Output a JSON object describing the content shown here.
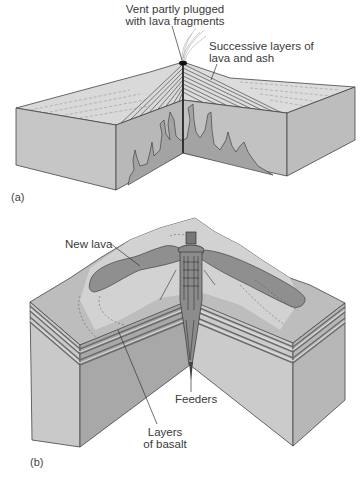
{
  "figure": {
    "panels": [
      {
        "tag": "(a)",
        "title": "Composite volcano cross-section",
        "labels": {
          "vent": [
            "Vent partly plugged",
            "with lava fragments"
          ],
          "layers": [
            "Successive layers of",
            "lava and ash"
          ]
        }
      },
      {
        "tag": "(b)",
        "title": "Fissure eruption / flood basalt cross-section",
        "labels": {
          "new_lava": "New lava",
          "feeders": "Feeders",
          "basalt": [
            "Layers",
            "of basalt"
          ]
        }
      }
    ],
    "colors": {
      "face_light": "#c9c9c9",
      "face_mid": "#b4b4b4",
      "face_dark": "#9d9d9d",
      "top_surface": "#d8d8d8",
      "lava": "#8f8f8f",
      "line": "#3a3a3a"
    }
  }
}
